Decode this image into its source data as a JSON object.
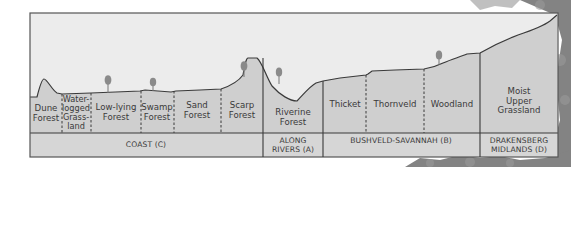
{
  "colors": {
    "sky": "#ececec",
    "land": "#cfcfcf",
    "band": "#d6d6d6",
    "line": "#3a3a3a",
    "tree": "#8a8a8a",
    "foliage": "#6a6a6a"
  },
  "vegetation_zones": [
    {
      "id": "dune-forest",
      "label": "Dune\nForest"
    },
    {
      "id": "waterlogged-grassland",
      "label": "Water-\nlogged\nGrass-\nland"
    },
    {
      "id": "low-lying-forest",
      "label": "Low-lying\nForest"
    },
    {
      "id": "swamp-forest",
      "label": "Swamp\nForest"
    },
    {
      "id": "sand-forest",
      "label": "Sand\nForest"
    },
    {
      "id": "scarp-forest",
      "label": "Scarp\nForest"
    },
    {
      "id": "riverine-forest",
      "label": "Riverine\nForest"
    },
    {
      "id": "thicket",
      "label": "Thicket"
    },
    {
      "id": "thornveld",
      "label": "Thornveld"
    },
    {
      "id": "woodland",
      "label": "Woodland"
    },
    {
      "id": "moist-upper-grassland",
      "label": "Moist\nUpper\nGrassland"
    }
  ],
  "regions": [
    {
      "id": "coast",
      "label": "COAST (C)"
    },
    {
      "id": "along-rivers",
      "label": "ALONG\nRIVERS (A)"
    },
    {
      "id": "bushveld-savannah",
      "label": "BUSHVELD-SAVANNAH (B)"
    },
    {
      "id": "drakensberg-midlands",
      "label": "DRAKENSBERG\nMIDLANDS (D)"
    }
  ]
}
